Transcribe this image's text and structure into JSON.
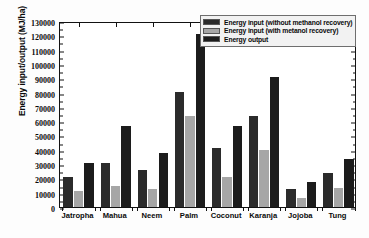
{
  "chart_data": {
    "type": "bar",
    "title": "",
    "xlabel": "",
    "ylabel": "Energy input/output (MJ/ha)",
    "ylim": [
      0,
      130000
    ],
    "ytick_step": 10000,
    "grid": false,
    "legend_position": "top-right",
    "categories": [
      "Jatropha",
      "Mahua",
      "Neem",
      "Palm",
      "Coconut",
      "Karanja",
      "Jojoba",
      "Tung"
    ],
    "yticks": [
      "0",
      "10000",
      "20000",
      "30000",
      "40000",
      "50000",
      "60000",
      "70000",
      "80000",
      "90000",
      "100000",
      "110000",
      "120000",
      "130000"
    ],
    "series": [
      {
        "name": "Energy input (without methanol recovery)",
        "color": "#2b2b2b",
        "values": [
          21000,
          31000,
          26000,
          81000,
          42000,
          64000,
          13000,
          24000
        ]
      },
      {
        "name": "Energy input (with metanol recovery)",
        "color": "#a6a6a6",
        "values": [
          11500,
          15000,
          12500,
          64000,
          21000,
          40000,
          6500,
          13500
        ]
      },
      {
        "name": "Energy output",
        "color": "#1c1c1c",
        "values": [
          31000,
          57000,
          38000,
          122000,
          57000,
          92000,
          17500,
          34000
        ]
      }
    ]
  },
  "legend": {
    "items": [
      {
        "label": "Energy input (without methanol recovery)"
      },
      {
        "label": "Energy input (with metanol recovery)"
      },
      {
        "label": "Energy output"
      }
    ]
  }
}
